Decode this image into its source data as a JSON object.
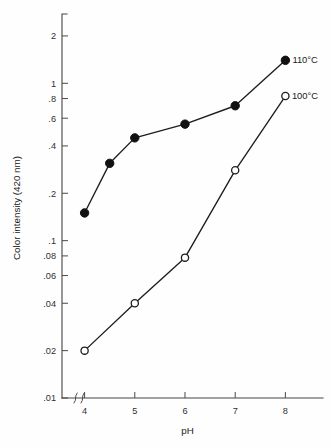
{
  "chart_data": {
    "type": "line",
    "title": "",
    "subtitle": "",
    "xlabel": "pH",
    "ylabel": "Color intensity (420 nm)",
    "x_scale": "linear",
    "y_scale": "log",
    "xlim": [
      3.55,
      8.55
    ],
    "ylim": [
      0.01,
      2.6
    ],
    "grid": false,
    "legend_position": "inline-right-of-series-endpoint",
    "axis_break": {
      "axis": "x",
      "symbol": "zigzag",
      "note": "break between y-axis and first x tick"
    },
    "x_ticks": [
      {
        "value": 4,
        "label": "4"
      },
      {
        "value": 5,
        "label": "5"
      },
      {
        "value": 6,
        "label": "6"
      },
      {
        "value": 7,
        "label": "7"
      },
      {
        "value": 8,
        "label": "8"
      }
    ],
    "y_ticks": [
      {
        "value": 0.01,
        "label": ".01"
      },
      {
        "value": 0.02,
        "label": ".02"
      },
      {
        "value": 0.04,
        "label": ".04"
      },
      {
        "value": 0.06,
        "label": ".06"
      },
      {
        "value": 0.08,
        "label": ".08"
      },
      {
        "value": 0.1,
        "label": ".1"
      },
      {
        "value": 0.2,
        "label": ".2"
      },
      {
        "value": 0.4,
        "label": ".4"
      },
      {
        "value": 0.6,
        "label": ".6"
      },
      {
        "value": 0.8,
        "label": ".8"
      },
      {
        "value": 1,
        "label": "1"
      },
      {
        "value": 2,
        "label": "2"
      }
    ],
    "series": [
      {
        "name": "110°C",
        "label": "110°C",
        "marker": "filled-circle",
        "color": "#111111",
        "x": [
          4,
          4.5,
          5,
          6,
          7,
          8
        ],
        "values": [
          0.15,
          0.31,
          0.45,
          0.55,
          0.72,
          1.4
        ]
      },
      {
        "name": "100°C",
        "label": "100°C",
        "marker": "open-circle",
        "color": "#1d1d1d",
        "x": [
          4,
          5,
          6,
          7,
          8
        ],
        "values": [
          0.02,
          0.04,
          0.078,
          0.28,
          0.83
        ]
      }
    ]
  }
}
